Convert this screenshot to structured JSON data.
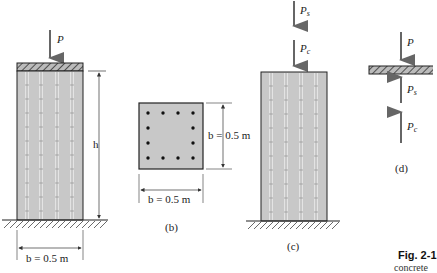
{
  "figure": {
    "panel_a": {
      "load_label": "P",
      "height_label": "h",
      "width_label": "b = 0.5 m"
    },
    "panel_b": {
      "height_label": "b = 0.5 m",
      "width_label": "b = 0.5 m",
      "caption": "(b)",
      "rebar_count": 12
    },
    "panel_c": {
      "load_steel_label": "P",
      "load_steel_sub": "s",
      "load_concrete_label": "P",
      "load_concrete_sub": "c",
      "caption": "(c)"
    },
    "panel_d": {
      "load_label": "P",
      "steel_reaction_label": "P",
      "steel_reaction_sub": "s",
      "concrete_reaction_label": "P",
      "concrete_reaction_sub": "c",
      "caption": "(d)"
    },
    "figure_caption": {
      "number": "Fig. 2-1",
      "text": "concrete"
    },
    "colors": {
      "column_fill": "#c8c8c8",
      "rebar_line": "#ffffff",
      "outline": "#333333",
      "arrow": "#666666"
    }
  }
}
